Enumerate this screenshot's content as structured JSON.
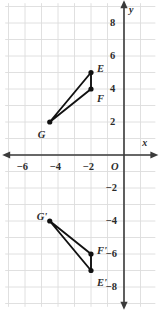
{
  "figure": {
    "type": "coordinate-plane",
    "title": "",
    "background": "#ffffff",
    "grid_color": "#dcdcdc",
    "axis_color": "#3a3a3a",
    "point_color": "#111111"
  },
  "axes": {
    "x_label": "x",
    "y_label": "y",
    "origin_label": "O",
    "x_ticks": [
      "-6",
      "-4",
      "-2"
    ],
    "y_ticks_positive": [
      "8",
      "6",
      "4",
      "2"
    ],
    "y_ticks_negative": [
      "-2",
      "-4",
      "-6",
      "-8"
    ],
    "x_range": [
      -7.2,
      1.9
    ],
    "y_range": [
      -9.2,
      9.2
    ],
    "unit_px": 16.5
  },
  "chart_data": {
    "type": "scatter",
    "title": "",
    "xlabel": "x",
    "ylabel": "y",
    "xlim": [
      -7.2,
      1.9
    ],
    "ylim": [
      -9.2,
      9.2
    ],
    "grid": true,
    "legend": "none",
    "xticks": [
      -6,
      -4,
      -2
    ],
    "yticks": [
      8,
      6,
      4,
      2,
      -2,
      -4,
      -6,
      -8
    ],
    "series": [
      {
        "name": "Triangle EFG",
        "closed": true,
        "points": [
          {
            "label": "E",
            "x": -2,
            "y": 5,
            "label_dx": 6,
            "label_dy": -9
          },
          {
            "label": "F",
            "x": -2,
            "y": 4,
            "label_dx": 6,
            "label_dy": 5
          },
          {
            "label": "G",
            "x": -4.5,
            "y": 2,
            "label_dx": -12,
            "label_dy": 8
          }
        ]
      },
      {
        "name": "Triangle E'F'G'",
        "closed": true,
        "points": [
          {
            "label": "E'",
            "x": -2,
            "y": -7,
            "label_dx": 6,
            "label_dy": 7
          },
          {
            "label": "F'",
            "x": -2,
            "y": -6,
            "label_dx": 6,
            "label_dy": -8
          },
          {
            "label": "G'",
            "x": -4.5,
            "y": -4,
            "label_dx": -13,
            "label_dy": -9
          }
        ]
      }
    ]
  }
}
